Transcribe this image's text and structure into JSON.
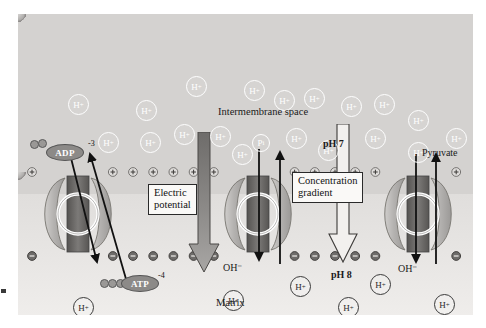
{
  "figure": {
    "type": "biological-cross-section"
  },
  "regions": {
    "intermembrane_space_label": "Intermembrane space",
    "matrix_label": "Matrix",
    "intermembrane_ph": "pH 7",
    "matrix_ph": "pH 8"
  },
  "callouts": [
    {
      "id": "electric-potential",
      "line1": "Electric",
      "line2": "potential"
    },
    {
      "id": "concentration-gradient",
      "line1": "Concentration",
      "line2": "gradient"
    }
  ],
  "molecules": {
    "adp": {
      "label": "ADP",
      "charge": "-3"
    },
    "atp": {
      "label": "ATP",
      "charge": "-4"
    },
    "phosphate": {
      "label": "P",
      "subscript": "i"
    },
    "pyruvate": {
      "label": "Pyruvate"
    },
    "hydroxide": {
      "label": "OH",
      "charge": "−"
    },
    "proton": {
      "label": "H",
      "charge": "+"
    }
  },
  "ion_labels": {
    "oh_left": "OH⁻",
    "oh_right": "OH⁻"
  },
  "protons_intermembrane": [
    {
      "x": 50,
      "y": 80
    },
    {
      "x": 118,
      "y": 86
    },
    {
      "x": 168,
      "y": 62
    },
    {
      "x": 226,
      "y": 66
    },
    {
      "x": 256,
      "y": 76
    },
    {
      "x": 286,
      "y": 74
    },
    {
      "x": 323,
      "y": 82
    },
    {
      "x": 356,
      "y": 80
    },
    {
      "x": 390,
      "y": 96
    },
    {
      "x": 80,
      "y": 118
    },
    {
      "x": 122,
      "y": 118
    },
    {
      "x": 156,
      "y": 110
    },
    {
      "x": 192,
      "y": 112
    },
    {
      "x": 214,
      "y": 130
    },
    {
      "x": 268,
      "y": 114
    },
    {
      "x": 300,
      "y": 126
    },
    {
      "x": 347,
      "y": 114
    },
    {
      "x": 390,
      "y": 128
    },
    {
      "x": 428,
      "y": 114
    }
  ],
  "protons_matrix": [
    {
      "x": 55,
      "y": 283
    },
    {
      "x": 205,
      "y": 276
    },
    {
      "x": 272,
      "y": 262
    },
    {
      "x": 320,
      "y": 283
    },
    {
      "x": 352,
      "y": 260
    },
    {
      "x": 416,
      "y": 280
    }
  ],
  "membrane_charges": {
    "positive_symbol": "+",
    "negative_symbol": "−",
    "positive_count": 22,
    "negative_count": 22
  },
  "transporters": [
    {
      "id": "atp-adp-translocase",
      "x": 60
    },
    {
      "id": "phosphate-carrier",
      "x": 240
    },
    {
      "id": "pyruvate-carrier",
      "x": 400
    }
  ],
  "colors": {
    "plate_background": "#e6e4e2",
    "intermembrane_fill": "#d4d2d0",
    "matrix_fill": "#efedeb",
    "membrane_head": "#bab8b6",
    "protein_lobe": "#b0aeac",
    "channel_dark": "#6e6c6a",
    "arrow_grey": "#8a8886",
    "ion_outline": "#ffffff",
    "text": "#1a1a1a"
  }
}
